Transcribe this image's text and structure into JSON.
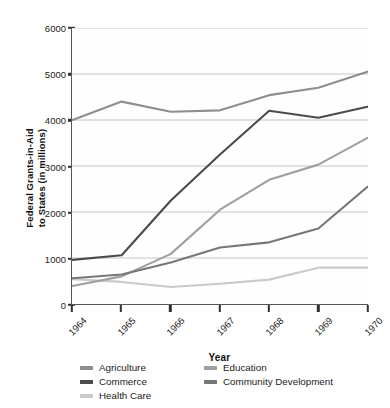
{
  "chart_data": {
    "type": "line",
    "title": "",
    "xlabel": "Year",
    "ylabel": "Federal Grants-in-Aid to States (in millions)",
    "ylabel_line1": "Federal Grants-in-Aid",
    "ylabel_line2": "to States (in millions)",
    "categories": [
      "1964",
      "1965",
      "1966",
      "1967",
      "1968",
      "1969",
      "1970"
    ],
    "x": [
      1964,
      1965,
      1966,
      1967,
      1968,
      1969,
      1970
    ],
    "ylim": [
      0,
      6000
    ],
    "yticks": [
      0,
      1000,
      2000,
      3000,
      4000,
      5000,
      6000
    ],
    "ytick_labels": [
      "0",
      "1000",
      "2000",
      "3000",
      "4000",
      "5000",
      "6000"
    ],
    "grid": "horizontal",
    "legend_position": "bottom",
    "series": [
      {
        "name": "Agriculture",
        "color": "#8e8e8e",
        "values": [
          4000,
          4400,
          4180,
          4210,
          4540,
          4700,
          5050
        ]
      },
      {
        "name": "Commerce",
        "color": "#4b4b4b",
        "values": [
          960,
          1060,
          2250,
          3250,
          4200,
          4050,
          4290
        ]
      },
      {
        "name": "Health Care",
        "color": "#cacaca",
        "values": [
          540,
          480,
          370,
          440,
          530,
          790,
          790
        ]
      },
      {
        "name": "Education",
        "color": "#a0a0a0",
        "values": [
          390,
          600,
          1090,
          2050,
          2700,
          3030,
          3610
        ]
      },
      {
        "name": "Community Development",
        "color": "#777777",
        "values": [
          560,
          640,
          900,
          1230,
          1340,
          1640,
          2550
        ]
      }
    ]
  },
  "legend": {
    "columns": [
      {
        "items": [
          "Agriculture",
          "Commerce",
          "Health Care"
        ]
      },
      {
        "items": [
          "Education",
          "Community Development"
        ]
      }
    ]
  },
  "colors": {
    "axis": "#55565a",
    "grid": "#b9b9b9",
    "text": "#1a1a1a",
    "background": "#ffffff"
  }
}
